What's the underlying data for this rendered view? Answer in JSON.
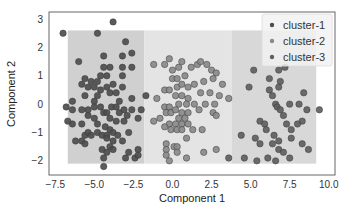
{
  "chart_data": {
    "type": "scatter",
    "title": "",
    "xlabel": "Component 1",
    "ylabel": "Component 2",
    "xlim": [
      -7.9,
      10.4
    ],
    "ylim": [
      -2.5,
      3.25
    ],
    "xticks": [
      -7.5,
      -5.0,
      -2.5,
      0.0,
      2.5,
      5.0,
      7.5,
      10.0
    ],
    "xtick_labels": [
      "−7.5",
      "−5.0",
      "−2.5",
      "0.0",
      "2.5",
      "5.0",
      "7.5",
      "10.0"
    ],
    "yticks": [
      -2,
      -1,
      0,
      1,
      2,
      3
    ],
    "ytick_labels": [
      "−2",
      "−1",
      "0",
      "1",
      "2",
      "3"
    ],
    "grid": false,
    "legend_position": "top-right",
    "background_regions": [
      {
        "cluster": "cluster-1",
        "x": [
          -6.7,
          -1.8
        ],
        "y": [
          -2.1,
          2.6
        ],
        "color": "#d0d0d0"
      },
      {
        "cluster": "cluster-2",
        "x": [
          -1.8,
          3.8
        ],
        "y": [
          -2.1,
          2.6
        ],
        "color": "#e4e4e4"
      },
      {
        "cluster": "cluster-3",
        "x": [
          3.8,
          9.2
        ],
        "y": [
          -2.1,
          2.6
        ],
        "color": "#d8d8d8"
      }
    ],
    "series": [
      {
        "name": "cluster-1",
        "color": "#4d4d4d",
        "points": [
          [
            -7.0,
            2.5
          ],
          [
            -4.8,
            2.5
          ],
          [
            -3.8,
            2.9
          ],
          [
            -3.0,
            2.2
          ],
          [
            -6.0,
            1.5
          ],
          [
            -4.4,
            1.7
          ],
          [
            -3.2,
            1.7
          ],
          [
            -2.6,
            1.8
          ],
          [
            -4.4,
            1.3
          ],
          [
            -4.0,
            1.3
          ],
          [
            -3.2,
            1.3
          ],
          [
            -2.6,
            1.3
          ],
          [
            -3.2,
            1.0
          ],
          [
            -4.6,
            1.0
          ],
          [
            -4.2,
            1.0
          ],
          [
            -4.8,
            0.8
          ],
          [
            -5.2,
            0.8
          ],
          [
            -5.6,
            0.9
          ],
          [
            -5.8,
            0.7
          ],
          [
            -5.4,
            0.6
          ],
          [
            -5.0,
            0.6
          ],
          [
            -4.6,
            0.5
          ],
          [
            -4.2,
            0.6
          ],
          [
            -3.8,
            0.7
          ],
          [
            -4.0,
            0.4
          ],
          [
            -4.8,
            0.3
          ],
          [
            -5.0,
            0.1
          ],
          [
            -3.6,
            0.4
          ],
          [
            -3.2,
            0.6
          ],
          [
            -5.6,
            0.3
          ],
          [
            -3.4,
            0.1
          ],
          [
            -4.6,
            -0.1
          ],
          [
            -2.6,
            0.2
          ],
          [
            -6.4,
            0.1
          ],
          [
            -6.8,
            -0.1
          ],
          [
            -6.4,
            -0.2
          ],
          [
            -5.8,
            -0.2
          ],
          [
            -5.4,
            -0.2
          ],
          [
            -5.0,
            -0.1
          ],
          [
            -4.4,
            -0.3
          ],
          [
            -4.2,
            -0.3
          ],
          [
            -3.9,
            -0.1
          ],
          [
            -3.6,
            -0.1
          ],
          [
            -3.4,
            -0.3
          ],
          [
            -3.1,
            -0.2
          ],
          [
            -2.9,
            -0.4
          ],
          [
            -2.6,
            -0.2
          ],
          [
            -2.0,
            -0.2
          ],
          [
            -5.4,
            -0.4
          ],
          [
            -5.0,
            -0.5
          ],
          [
            -4.8,
            -0.7
          ],
          [
            -4.0,
            -0.5
          ],
          [
            -3.6,
            -0.6
          ],
          [
            -3.1,
            -0.6
          ],
          [
            -6.4,
            -0.7
          ],
          [
            -5.8,
            -0.7
          ],
          [
            -4.3,
            -0.8
          ],
          [
            -4.0,
            -0.9
          ],
          [
            -3.8,
            -1.0
          ],
          [
            -5.6,
            -1.1
          ],
          [
            -5.4,
            -1.0
          ],
          [
            -5.2,
            -1.1
          ],
          [
            -4.8,
            -1.0
          ],
          [
            -4.5,
            -1.1
          ],
          [
            -4.2,
            -1.1
          ],
          [
            -3.5,
            -1.1
          ],
          [
            -2.8,
            -1.0
          ],
          [
            -5.8,
            -1.3
          ],
          [
            -5.6,
            -1.4
          ],
          [
            -4.2,
            -1.2
          ],
          [
            -3.8,
            -1.3
          ],
          [
            -3.2,
            -1.3
          ],
          [
            -4.0,
            -1.5
          ],
          [
            -3.8,
            -1.6
          ],
          [
            -4.5,
            -1.6
          ],
          [
            -4.2,
            -1.7
          ],
          [
            -2.8,
            -1.7
          ],
          [
            -2.2,
            -1.6
          ],
          [
            -4.4,
            -1.9
          ],
          [
            -3.0,
            -1.9
          ],
          [
            -2.4,
            -1.9
          ],
          [
            -4.4,
            -2.2
          ],
          [
            -2.2,
            -1.8
          ],
          [
            -2.2,
            -0.5
          ],
          [
            -1.7,
            0.3
          ],
          [
            -6.7,
            -0.6
          ],
          [
            -6.2,
            -1.3
          ]
        ]
      },
      {
        "name": "cluster-2",
        "color": "#8a8a8a",
        "points": [
          [
            -1.2,
            1.4
          ],
          [
            -0.5,
            1.4
          ],
          [
            -0.2,
            1.6
          ],
          [
            0.0,
            1.2
          ],
          [
            0.4,
            1.3
          ],
          [
            0.6,
            1.5
          ],
          [
            0.0,
            0.9
          ],
          [
            0.3,
            0.9
          ],
          [
            0.8,
            1.0
          ],
          [
            1.2,
            1.3
          ],
          [
            1.6,
            1.4
          ],
          [
            1.8,
            1.5
          ],
          [
            2.2,
            1.4
          ],
          [
            2.5,
            1.2
          ],
          [
            2.8,
            1.1
          ],
          [
            -0.5,
            0.5
          ],
          [
            -0.2,
            0.5
          ],
          [
            0.3,
            0.6
          ],
          [
            0.6,
            0.7
          ],
          [
            1.0,
            0.6
          ],
          [
            1.4,
            0.7
          ],
          [
            2.0,
            0.8
          ],
          [
            2.6,
            0.9
          ],
          [
            3.2,
            0.7
          ],
          [
            0.2,
            0.3
          ],
          [
            0.6,
            0.3
          ],
          [
            1.0,
            0.2
          ],
          [
            1.8,
            0.4
          ],
          [
            2.4,
            0.4
          ],
          [
            3.0,
            0.3
          ],
          [
            -0.5,
            -0.1
          ],
          [
            -0.2,
            -0.1
          ],
          [
            0.4,
            0.0
          ],
          [
            0.9,
            0.0
          ],
          [
            1.4,
            0.0
          ],
          [
            2.1,
            0.0
          ],
          [
            3.6,
            0.2
          ],
          [
            -0.4,
            -0.3
          ],
          [
            -0.1,
            -0.3
          ],
          [
            0.2,
            -0.2
          ],
          [
            0.6,
            -0.3
          ],
          [
            1.0,
            -0.3
          ],
          [
            0.4,
            -0.5
          ],
          [
            0.8,
            -0.5
          ],
          [
            -0.2,
            -0.7
          ],
          [
            0.2,
            -0.7
          ],
          [
            0.6,
            -0.7
          ],
          [
            1.0,
            -0.7
          ],
          [
            -0.8,
            -0.5
          ],
          [
            -1.2,
            -0.6
          ],
          [
            -0.5,
            -0.8
          ],
          [
            -0.1,
            -0.9
          ],
          [
            0.3,
            -0.9
          ],
          [
            0.6,
            -0.9
          ],
          [
            1.3,
            -0.9
          ],
          [
            1.9,
            -0.9
          ],
          [
            2.6,
            -0.3
          ],
          [
            2.8,
            -0.4
          ],
          [
            0.9,
            -1.2
          ],
          [
            -0.4,
            -1.4
          ],
          [
            -0.4,
            -1.6
          ],
          [
            0.1,
            -1.5
          ],
          [
            0.3,
            -1.5
          ],
          [
            0.3,
            -1.7
          ],
          [
            -0.4,
            -1.8
          ],
          [
            2.0,
            -1.7
          ],
          [
            2.8,
            -1.6
          ],
          [
            -0.2,
            -2.0
          ],
          [
            0.9,
            -1.9
          ],
          [
            1.7,
            -0.2
          ],
          [
            2.7,
            0.0
          ],
          [
            -1.0,
            0.2
          ]
        ]
      },
      {
        "name": "cluster-3",
        "color": "#5f5f5f",
        "points": [
          [
            5.2,
            1.2
          ],
          [
            6.2,
            0.9
          ],
          [
            6.8,
            1.2
          ],
          [
            7.2,
            1.3
          ],
          [
            6.2,
            0.5
          ],
          [
            6.8,
            0.6
          ],
          [
            6.4,
            0.3
          ],
          [
            6.6,
            0.0
          ],
          [
            6.7,
            -0.1
          ],
          [
            6.9,
            -0.2
          ],
          [
            7.5,
            0.0
          ],
          [
            8.4,
            0.4
          ],
          [
            8.6,
            -0.2
          ],
          [
            9.4,
            -0.2
          ],
          [
            8.3,
            -0.6
          ],
          [
            8.0,
            -0.7
          ],
          [
            7.6,
            -0.9
          ],
          [
            7.3,
            -0.7
          ],
          [
            5.6,
            -0.6
          ],
          [
            5.9,
            -0.7
          ],
          [
            6.5,
            -1.1
          ],
          [
            6.8,
            -1.3
          ],
          [
            6.4,
            -1.4
          ],
          [
            5.6,
            -1.4
          ],
          [
            6.8,
            -1.6
          ],
          [
            7.5,
            -1.9
          ],
          [
            6.6,
            -2.0
          ],
          [
            5.3,
            -1.2
          ],
          [
            4.6,
            -1.9
          ],
          [
            3.6,
            -1.9
          ],
          [
            8.3,
            -1.4
          ],
          [
            8.7,
            -1.6
          ],
          [
            6.1,
            -1.9
          ],
          [
            7.1,
            -1.7
          ],
          [
            5.4,
            -2.0
          ],
          [
            4.4,
            -1.1
          ],
          [
            6.0,
            -0.9
          ],
          [
            7.1,
            -0.4
          ],
          [
            8.1,
            0.0
          ],
          [
            6.9,
            0.8
          ],
          [
            4.9,
            0.6
          ],
          [
            7.6,
            -1.2
          ]
        ]
      }
    ]
  }
}
